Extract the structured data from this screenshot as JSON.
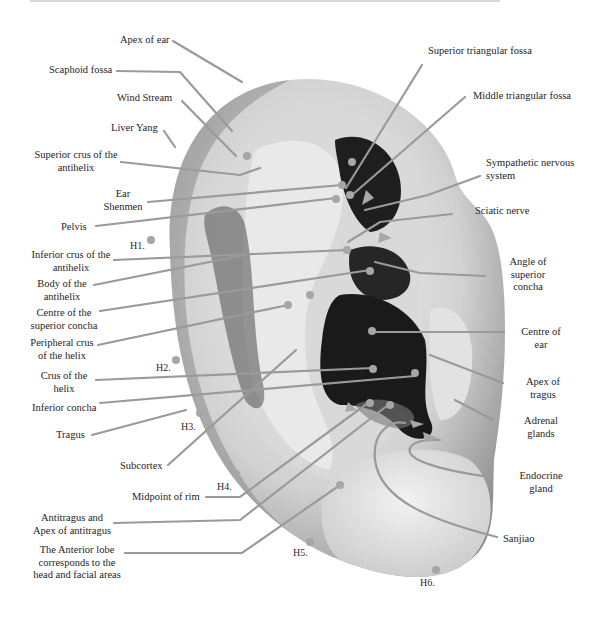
{
  "diagram": {
    "type": "anatomical-ear-auricular-points",
    "line_color": "#9a9a9a",
    "ear_colors": {
      "skin_light": "#e6e6e6",
      "skin_mid": "#b4b4b4",
      "shadow": "#1c1c1c"
    }
  },
  "labels_left": [
    {
      "id": "apex-of-ear",
      "text": "Apex of ear"
    },
    {
      "id": "scaphoid-fossa",
      "text": "Scaphoid fossa"
    },
    {
      "id": "wind-stream",
      "text": "Wind Stream"
    },
    {
      "id": "liver-yang",
      "text": "Liver Yang"
    },
    {
      "id": "superior-crus-antihelix",
      "line1": "Superior crus of the",
      "line2": "antihelix"
    },
    {
      "id": "ear-shenmen",
      "line1": "Ear",
      "line2": "Shenmen"
    },
    {
      "id": "pelvis",
      "text": "Pelvis"
    },
    {
      "id": "inferior-crus-antihelix",
      "line1": "Inferior crus of the",
      "line2": "antihelix"
    },
    {
      "id": "body-antihelix",
      "line1": "Body of the",
      "line2": "antihelix"
    },
    {
      "id": "centre-superior-concha",
      "line1": "Centre of the",
      "line2": "superior concha"
    },
    {
      "id": "peripheral-crus-helix",
      "line1": "Peripheral crus",
      "line2": "of the helix"
    },
    {
      "id": "crus-helix",
      "line1": "Crus of the",
      "line2": "helix"
    },
    {
      "id": "inferior-concha",
      "text": "Inferior concha"
    },
    {
      "id": "tragus",
      "text": "Tragus"
    },
    {
      "id": "subcortex",
      "text": "Subcortex"
    },
    {
      "id": "midpoint-of-rim",
      "text": "Midpoint of rim"
    },
    {
      "id": "antitragus",
      "line1": "Antitragus and",
      "line2": "Apex of antitragus"
    },
    {
      "id": "anterior-lobe",
      "line1": "The Anterior lobe",
      "line2": "corresponds to the",
      "line3": "head and facial areas"
    }
  ],
  "labels_right": [
    {
      "id": "superior-triangular-fossa",
      "text": "Superior triangular fossa"
    },
    {
      "id": "middle-triangular-fossa",
      "text": "Middle triangular fossa"
    },
    {
      "id": "sympathetic-nervous-system",
      "line1": "Sympathetic nervous",
      "line2": "system"
    },
    {
      "id": "sciatic-nerve",
      "text": "Sciatic nerve"
    },
    {
      "id": "angle-superior-concha",
      "line1": "Angle of",
      "line2": "superior",
      "line3": "concha"
    },
    {
      "id": "centre-of-ear",
      "line1": "Centre of",
      "line2": "ear"
    },
    {
      "id": "apex-of-tragus",
      "line1": "Apex of",
      "line2": "tragus"
    },
    {
      "id": "adrenal-glands",
      "line1": "Adrenal",
      "line2": "glands"
    },
    {
      "id": "endocrine-gland",
      "line1": "Endocrine",
      "line2": "gland"
    },
    {
      "id": "sanjiao",
      "text": "Sanjiao"
    }
  ],
  "helix_markers": [
    "H1.",
    "H2.",
    "H3.",
    "H4.",
    "H5.",
    "H6."
  ]
}
